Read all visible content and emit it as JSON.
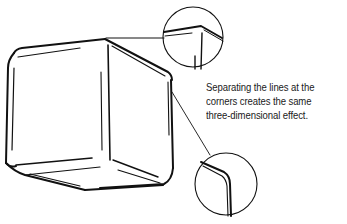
{
  "caption": {
    "lines": [
      "Separating the lines at the",
      "corners creates the same",
      "three-dimensional effect."
    ]
  },
  "illustration": {
    "subject": "cube drawn with separated corner lines",
    "callouts": [
      {
        "name": "top-corner-magnifier",
        "shows": "top-right corner with separated lines"
      },
      {
        "name": "side-corner-magnifier",
        "shows": "right edge corner with separated lines"
      }
    ],
    "stroke_color": "#111111",
    "background_color": "#ffffff"
  }
}
